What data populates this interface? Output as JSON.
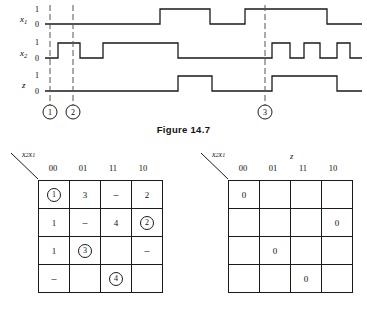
{
  "figure": {
    "caption": "Figure 14.7",
    "timing": {
      "signals": [
        {
          "name": "x",
          "subscript": "1",
          "levels": [
            "1",
            "0"
          ]
        },
        {
          "name": "x",
          "subscript": "2",
          "levels": [
            "1",
            "0"
          ]
        },
        {
          "name": "z",
          "subscript": "",
          "levels": [
            "1",
            "0"
          ]
        }
      ],
      "markers": [
        {
          "label": "1",
          "x": 50
        },
        {
          "label": "2",
          "x": 73
        },
        {
          "label": "3",
          "x": 265
        }
      ],
      "waveforms": {
        "x1": {
          "start": 0,
          "transitions": [
            160,
            210,
            245,
            327
          ]
        },
        "x2": {
          "start": 0,
          "transitions": [
            58,
            80,
            103,
            178,
            272,
            290,
            304,
            320,
            337,
            350
          ]
        },
        "z": {
          "start": 0,
          "transitions": [
            178,
            212,
            230,
            272,
            312,
            337
          ]
        }
      }
    }
  },
  "kmap_left": {
    "corner_label": "x2x1",
    "corner_main": "x",
    "corner_sub1": "2",
    "corner_main2": "x",
    "corner_sub2": "1",
    "top_label": "",
    "columns": [
      "00",
      "01",
      "11",
      "10"
    ],
    "rows": [
      [
        {
          "text": "1",
          "circled": true
        },
        {
          "text": "3",
          "circled": false
        },
        {
          "text": "–",
          "circled": false
        },
        {
          "text": "2",
          "circled": false
        }
      ],
      [
        {
          "text": "1",
          "circled": false
        },
        {
          "text": "–",
          "circled": false
        },
        {
          "text": "4",
          "circled": false
        },
        {
          "text": "2",
          "circled": true
        }
      ],
      [
        {
          "text": "1",
          "circled": false
        },
        {
          "text": "3",
          "circled": true
        },
        {
          "text": "",
          "circled": false
        },
        {
          "text": "–",
          "circled": false
        }
      ],
      [
        {
          "text": "–",
          "circled": false
        },
        {
          "text": "",
          "circled": false
        },
        {
          "text": "4",
          "circled": true
        },
        {
          "text": "",
          "circled": false
        }
      ]
    ]
  },
  "kmap_right": {
    "corner_main": "x",
    "corner_sub1": "2",
    "corner_main2": "x",
    "corner_sub2": "1",
    "top_label": "z",
    "columns": [
      "00",
      "01",
      "11",
      "10"
    ],
    "rows": [
      [
        {
          "text": "0",
          "circled": false
        },
        {
          "text": "",
          "circled": false
        },
        {
          "text": "",
          "circled": false
        },
        {
          "text": "",
          "circled": false
        }
      ],
      [
        {
          "text": "",
          "circled": false
        },
        {
          "text": "",
          "circled": false
        },
        {
          "text": "",
          "circled": false
        },
        {
          "text": "0",
          "circled": false
        }
      ],
      [
        {
          "text": "",
          "circled": false
        },
        {
          "text": "0",
          "circled": false
        },
        {
          "text": "",
          "circled": false
        },
        {
          "text": "",
          "circled": false
        }
      ],
      [
        {
          "text": "",
          "circled": false
        },
        {
          "text": "",
          "circled": false
        },
        {
          "text": "0",
          "circled": false
        },
        {
          "text": "",
          "circled": false
        }
      ]
    ]
  },
  "colors": {
    "line": "#1a1a1a",
    "dash": "#555555",
    "background": "#ffffff"
  }
}
